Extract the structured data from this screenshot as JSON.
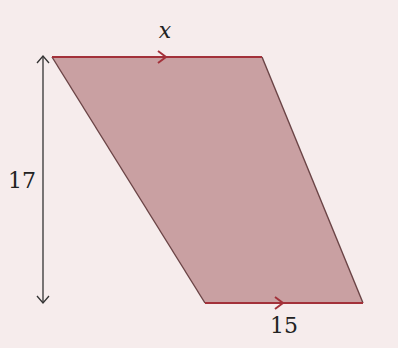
{
  "diagram": {
    "shape": "parallelogram/trapezoid with parallel top and bottom sides",
    "labels": {
      "top": "x",
      "height": "17",
      "bottom": "15"
    },
    "colors": {
      "background": "#f6ecec",
      "fill": "#c9a0a2",
      "edge": "#a3313a",
      "side_edge": "#6b4446",
      "dimension_arrow": "#333333"
    }
  }
}
